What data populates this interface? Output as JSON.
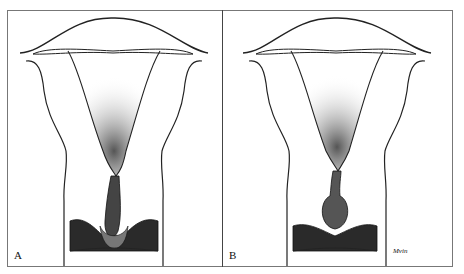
{
  "figure": {
    "panels": [
      {
        "label": "A",
        "description": "Uterus with elongated polypoid lesion extending through cervical canal"
      },
      {
        "label": "B",
        "description": "Uterus with rounded polypoid mass in cervical canal"
      }
    ],
    "signature": "Mvin"
  },
  "colors": {
    "ink": "#111111",
    "frame": "#777777",
    "background": "#ffffff"
  }
}
